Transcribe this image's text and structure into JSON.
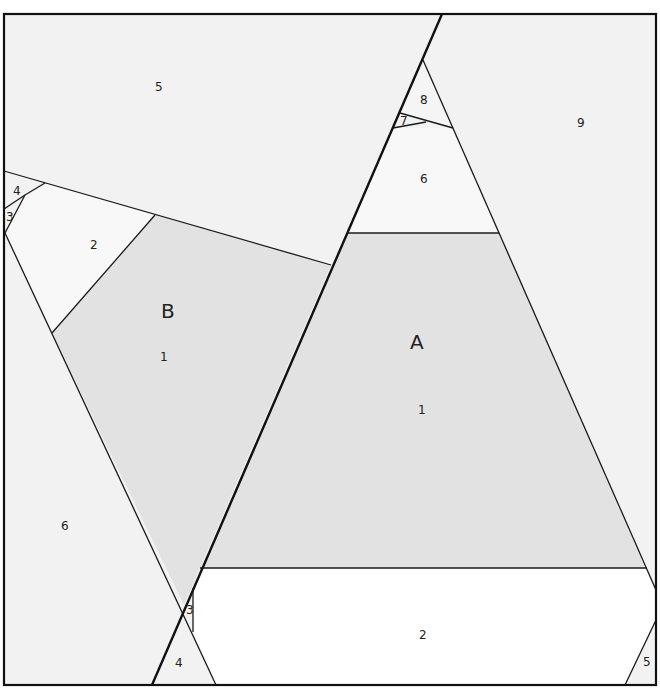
{
  "colors": {
    "shaded": "#e2e2e2",
    "light": "#f2f2f2",
    "lighter": "#f8f8f8",
    "white": "#ffffff",
    "line": "#1a1a1a"
  },
  "regions": {
    "top_left_5": {
      "label": "5"
    },
    "top_left_4": {
      "label": "4"
    },
    "top_left_3": {
      "label": "3"
    },
    "left_2": {
      "label": "2"
    },
    "B_1": {
      "label": "1"
    },
    "left_6": {
      "label": "6"
    },
    "bottom_3": {
      "label": "3"
    },
    "bottom_4": {
      "label": "4"
    },
    "top_8": {
      "label": "8"
    },
    "top_7": {
      "label": "7"
    },
    "top_6": {
      "label": "6"
    },
    "right_9": {
      "label": "9"
    },
    "A_1": {
      "label": "1"
    },
    "bottom_2": {
      "label": "2"
    },
    "bottom_right_5": {
      "label": "5"
    }
  },
  "shapes": {
    "A": {
      "label": "A"
    },
    "B": {
      "label": "B"
    }
  }
}
